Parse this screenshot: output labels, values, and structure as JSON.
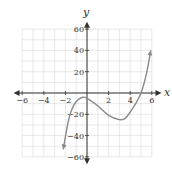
{
  "chart_data": {
    "type": "line",
    "title": "",
    "xlabel": "x",
    "ylabel": "y",
    "xlim": [
      -6,
      6
    ],
    "ylim": [
      -60,
      60
    ],
    "grid": true,
    "x_ticks": [
      -6,
      -4,
      -2,
      2,
      4,
      6
    ],
    "y_ticks": [
      60,
      40,
      20,
      -20,
      -40,
      -60
    ],
    "x_tick_labels": [
      "−6",
      "−4",
      "−2",
      "2",
      "4",
      "6"
    ],
    "y_tick_labels": [
      "60",
      "40",
      "20",
      "−20",
      "−40",
      "−60"
    ],
    "series": [
      {
        "name": "f(x)",
        "x": [
          -2.2,
          -1.8,
          -1.5,
          -1.0,
          -0.4,
          0.0,
          1.0,
          2.0,
          3.0,
          3.5,
          4.0,
          4.5,
          5.0,
          5.5,
          5.9
        ],
        "y": [
          -53,
          -30,
          -18,
          -8,
          -4,
          -5,
          -12,
          -21,
          -25,
          -24,
          -18,
          -10,
          0,
          18,
          40
        ],
        "arrows": "both-ends"
      }
    ],
    "features": {
      "local_max": [
        -0.4,
        -4
      ],
      "local_min": [
        3,
        -25
      ],
      "x_intercept": 5
    }
  },
  "colors": {
    "curve": "#8a8a8a",
    "axis": "#333333",
    "grid": "#d8d8d8"
  }
}
